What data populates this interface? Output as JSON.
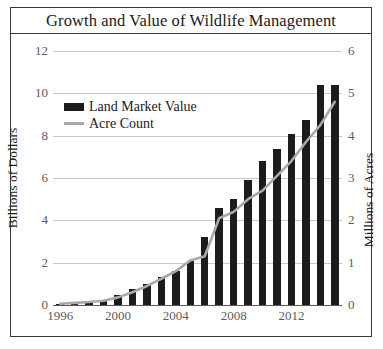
{
  "chart_data": {
    "type": "bar",
    "title": "Growth and Value of Wildlife Management",
    "xlabel": "",
    "ylabel": "Billions of Dollars",
    "y2label": "Millions of Acres",
    "grid": true,
    "legend_position": "upper-left-inside",
    "ylim": [
      0,
      12
    ],
    "y2lim": [
      0,
      6
    ],
    "yticks": [
      "0",
      "2",
      "4",
      "6",
      "8",
      "10",
      "12"
    ],
    "y2ticks": [
      "0",
      "1",
      "2",
      "3",
      "4",
      "5",
      "6"
    ],
    "xticks": [
      "1996",
      "2000",
      "2004",
      "2008",
      "2012"
    ],
    "categories": [
      "1996",
      "1997",
      "1998",
      "1999",
      "2000",
      "2001",
      "2002",
      "2003",
      "2004",
      "2005",
      "2006",
      "2007",
      "2008",
      "2009",
      "2010",
      "2011",
      "2012",
      "2013",
      "2014",
      "2015"
    ],
    "series": [
      {
        "name": "Land Market Value",
        "axis": "left",
        "kind": "bar",
        "color": "#1c1c1c",
        "unit": "Billions of Dollars",
        "values": [
          0.05,
          0.08,
          0.15,
          0.25,
          0.45,
          0.75,
          1.0,
          1.3,
          1.6,
          2.1,
          3.2,
          4.6,
          5.0,
          5.9,
          6.8,
          7.35,
          8.1,
          8.75,
          10.4,
          10.4
        ]
      },
      {
        "name": "Acre Count",
        "axis": "right",
        "kind": "line",
        "color": "#a9a9a9",
        "unit": "Millions of Acres",
        "values": [
          0.03,
          0.05,
          0.07,
          0.1,
          0.18,
          0.3,
          0.45,
          0.62,
          0.8,
          1.05,
          1.15,
          2.05,
          2.2,
          2.5,
          2.7,
          3.05,
          3.4,
          3.85,
          4.25,
          4.8
        ]
      }
    ]
  },
  "legend": {
    "items": [
      {
        "label": "Land Market Value",
        "swatch": "bar-swatch"
      },
      {
        "label": "Acre Count",
        "swatch": "line-swatch"
      }
    ]
  },
  "colors": {
    "bar": "#1c1c1c",
    "line": "#a9a9a9",
    "grid": "#c9c9c9",
    "axis": "#5a5a5a",
    "frame": "#3a3a3a",
    "text": "#1a1a1a",
    "tick_text": "#5c5c5c"
  }
}
